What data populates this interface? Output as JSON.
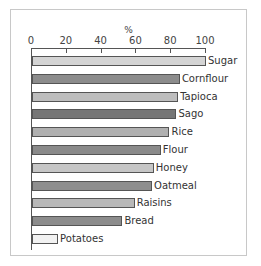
{
  "chart_data": {
    "type": "bar",
    "orientation": "horizontal",
    "title": "",
    "xlabel": "%",
    "ylabel": "",
    "xlim": [
      0,
      100
    ],
    "xticks": [
      0,
      20,
      40,
      60,
      80,
      100
    ],
    "xaxis_position": "top",
    "grid": false,
    "legend": null,
    "categories": [
      "Sugar",
      "Cornflour",
      "Tapioca",
      "Sago",
      "Rice",
      "Flour",
      "Honey",
      "Oatmeal",
      "Raisins",
      "Bread",
      "Potatoes"
    ],
    "values": [
      100,
      85,
      84,
      83,
      79,
      74,
      70,
      69,
      59,
      52,
      15
    ],
    "bar_colors": [
      "#d4d4d4",
      "#8c8c8c",
      "#bdbdbd",
      "#767676",
      "#b0b0b0",
      "#8a8a8a",
      "#c6c6c6",
      "#8e8e8e",
      "#b8b8b8",
      "#8c8c8c",
      "#f2f2f2"
    ]
  },
  "axis": {
    "unit": "%",
    "ticks": [
      "0",
      "20",
      "40",
      "60",
      "80",
      "100"
    ]
  }
}
